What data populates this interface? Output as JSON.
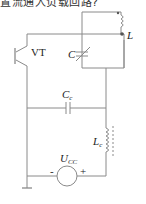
{
  "caption_fragment": "置流通入负载回路?",
  "components": {
    "transistor": {
      "label": "VT"
    },
    "tank_inductor": {
      "label": "L"
    },
    "tank_capacitor": {
      "label": "C",
      "type": "variable"
    },
    "coupling_capacitor": {
      "label": "C",
      "subscript": "c"
    },
    "choke_inductor": {
      "label": "L",
      "subscript": "c"
    },
    "supply": {
      "label": "U",
      "subscript": "CC",
      "minus": "-",
      "plus": "+"
    }
  },
  "colors": {
    "wire": "#8a8a8a",
    "text": "#222222"
  }
}
